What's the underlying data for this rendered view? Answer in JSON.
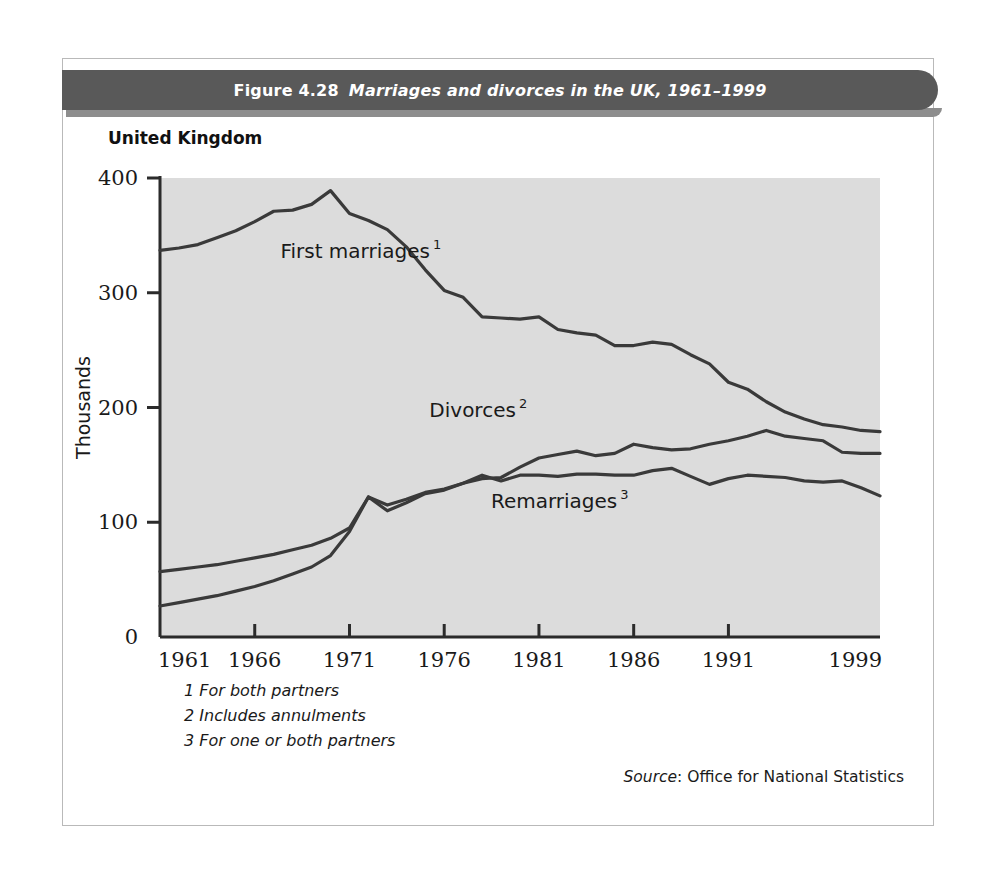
{
  "figure": {
    "number": "Figure 4.28",
    "title": "Marriages and divorces in the UK, 1961–1999",
    "country_label": "United Kingdom",
    "source_word": "Source",
    "source_text": ": Office for National Statistics",
    "footnotes": [
      "1 For both partners",
      "2 Includes annulments",
      "3 For one or both partners"
    ]
  },
  "colors": {
    "banner": "#595959",
    "banner_shadow": "#8d8d8d",
    "plot_background": "#dcdcdc",
    "line": "#3a3a3a",
    "axis": "#2b2b2b",
    "text": "#1a1a1a",
    "page": "#ffffff"
  },
  "chart_data": {
    "type": "line",
    "title": "Marriages and divorces in the UK, 1961–1999",
    "subtitle": "United Kingdom",
    "xlabel": "",
    "ylabel": "Thousands",
    "xlim": [
      1961,
      1999
    ],
    "ylim": [
      0,
      400
    ],
    "grid": false,
    "legend": "inline-labels",
    "xticks": [
      1961,
      1966,
      1971,
      1976,
      1981,
      1986,
      1991,
      1999
    ],
    "xtick_labels": [
      "1961",
      "1966",
      "1971",
      "1976",
      "1981",
      "1986",
      "1991",
      "1999"
    ],
    "yticks": [
      0,
      100,
      200,
      300,
      400
    ],
    "ytick_labels": [
      "0",
      "100",
      "200",
      "300",
      "400"
    ],
    "x": [
      1961,
      1962,
      1963,
      1964,
      1965,
      1966,
      1967,
      1968,
      1969,
      1970,
      1971,
      1972,
      1973,
      1974,
      1975,
      1976,
      1977,
      1978,
      1979,
      1980,
      1981,
      1982,
      1983,
      1984,
      1985,
      1986,
      1987,
      1988,
      1989,
      1990,
      1991,
      1992,
      1993,
      1994,
      1995,
      1996,
      1997,
      1998,
      1999
    ],
    "series": [
      {
        "name": "First marriages",
        "footnote": "1",
        "label_text": "First marriages",
        "label_sup": "1",
        "values": [
          337,
          339,
          342,
          348,
          354,
          362,
          371,
          372,
          377,
          389,
          369,
          363,
          355,
          340,
          320,
          302,
          296,
          279,
          278,
          277,
          279,
          268,
          265,
          263,
          254,
          254,
          257,
          255,
          246,
          238,
          222,
          216,
          205,
          196,
          190,
          185,
          183,
          180,
          179
        ]
      },
      {
        "name": "Divorces",
        "footnote": "2",
        "label_text": "Divorces",
        "label_sup": "2",
        "values": [
          27,
          30,
          33,
          36,
          40,
          44,
          49,
          55,
          61,
          71,
          92,
          122,
          110,
          117,
          125,
          128,
          134,
          138,
          139,
          148,
          156,
          159,
          162,
          158,
          160,
          168,
          165,
          163,
          164,
          168,
          171,
          175,
          180,
          175,
          173,
          171,
          161,
          160,
          160
        ]
      },
      {
        "name": "Remarriages",
        "footnote": "3",
        "label_text": "Remarriages",
        "label_sup": "3",
        "values": [
          57,
          59,
          61,
          63,
          66,
          69,
          72,
          76,
          80,
          86,
          95,
          122,
          115,
          120,
          126,
          129,
          134,
          141,
          136,
          141,
          141,
          140,
          142,
          142,
          141,
          141,
          145,
          147,
          140,
          133,
          138,
          141,
          140,
          139,
          136,
          135,
          136,
          130,
          123
        ]
      }
    ],
    "annotations": [
      {
        "text": "First marriages",
        "sup": "1",
        "x": 1971.3,
        "y": 330
      },
      {
        "text": "Divorces",
        "sup": "2",
        "x": 1977.5,
        "y": 192
      },
      {
        "text": "Remarriages",
        "sup": "3",
        "x": 1981.8,
        "y": 112
      }
    ]
  }
}
